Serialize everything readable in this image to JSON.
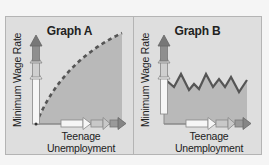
{
  "figure": {
    "panels": [
      {
        "id": "A",
        "title": "Graph A",
        "ylabel": "Minimum Wage Rate",
        "xlabel_line1": "Teenage",
        "xlabel_line2": "Unemployment",
        "curve_style": "dashed concave increasing",
        "description": "Teenage unemployment rises steadily as minimum wage rate increases"
      },
      {
        "id": "B",
        "title": "Graph B",
        "ylabel": "Minimum Wage Rate",
        "xlabel_line1": "Teenage",
        "xlabel_line2": "Unemployment",
        "curve_style": "solid zigzag flat",
        "description": "Teenage unemployment fluctuates but shows no trend with minimum wage rate"
      }
    ],
    "colors": {
      "background": "#f5f5f5",
      "panel_fill": "#dedede",
      "shaded_area": "#b9b9b9",
      "curve": "#555555",
      "axis_arrow_dark": "#6f6f6f",
      "axis_arrow_light": "#f2f2f2"
    },
    "icons": [
      "up-arrow-icon",
      "right-arrow-icon"
    ]
  }
}
